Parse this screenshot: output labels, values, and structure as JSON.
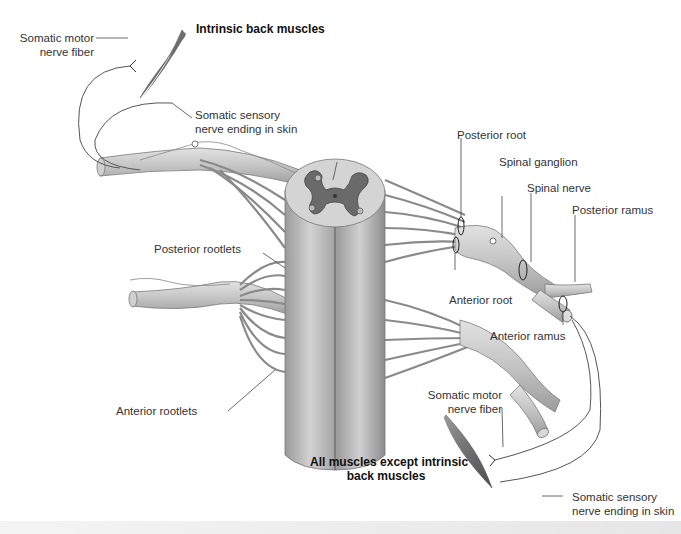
{
  "diagram": {
    "labels": {
      "intrinsic_back_muscles": "Intrinsic back muscles",
      "somatic_motor_top_1": "Somatic motor",
      "somatic_motor_top_2": "nerve fiber",
      "somatic_sensory_top_1": "Somatic sensory",
      "somatic_sensory_top_2": "nerve ending in skin",
      "posterior_root": "Posterior root",
      "spinal_ganglion": "Spinal ganglion",
      "spinal_nerve": "Spinal nerve",
      "posterior_ramus": "Posterior ramus",
      "posterior_rootlets": "Posterior rootlets",
      "anterior_root": "Anterior root",
      "anterior_ramus": "Anterior ramus",
      "anterior_rootlets": "Anterior rootlets",
      "somatic_motor_bottom_1": "Somatic motor",
      "somatic_motor_bottom_2": "nerve fiber",
      "all_muscles_1": "All muscles except intrinsic",
      "all_muscles_2": "back muscles",
      "somatic_sensory_bottom_1": "Somatic sensory",
      "somatic_sensory_bottom_2": "nerve ending in skin"
    },
    "colors": {
      "cord_light": "#d6d6d6",
      "cord_mid": "#b4b4b4",
      "cord_dark": "#8e8e8e",
      "grey_matter": "#6a6a6a",
      "nerve": "#c9c9c9",
      "nerve_outline": "#7a7a7a",
      "muscle": "#7c7c7c",
      "leader": "#444444"
    }
  }
}
